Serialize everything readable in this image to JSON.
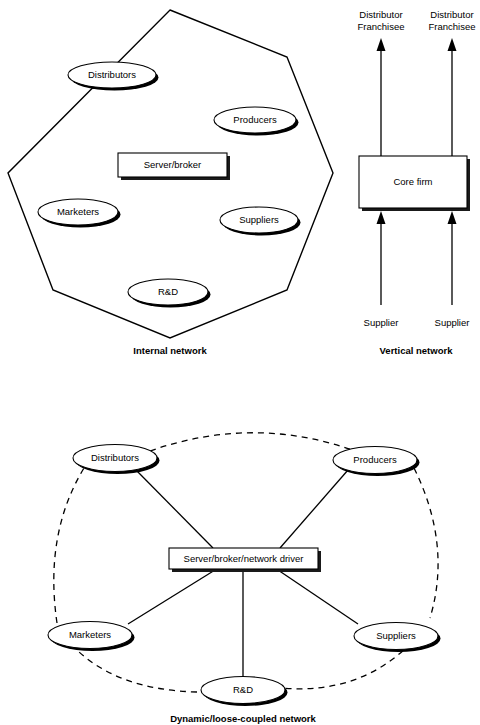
{
  "figure": {
    "panels": [
      {
        "id": "internal-network",
        "caption": "Internal network",
        "center_box": "Server/broker",
        "nodes": [
          {
            "id": "distributors",
            "label": "Distributors"
          },
          {
            "id": "producers",
            "label": "Producers"
          },
          {
            "id": "marketers",
            "label": "Marketers"
          },
          {
            "id": "suppliers",
            "label": "Suppliers"
          },
          {
            "id": "rnd",
            "label": "R&D"
          }
        ]
      },
      {
        "id": "vertical-network",
        "caption": "Vertical network",
        "center_box": "Core firm",
        "top_labels": [
          {
            "id": "distributor-franchisee-left",
            "line1": "Distributor",
            "line2": "Franchisee"
          },
          {
            "id": "distributor-franchisee-right",
            "line1": "Distributor",
            "line2": "Franchisee"
          }
        ],
        "bottom_labels": [
          {
            "id": "supplier-left",
            "label": "Supplier"
          },
          {
            "id": "supplier-right",
            "label": "Supplier"
          }
        ]
      },
      {
        "id": "dynamic-network",
        "caption": "Dynamic/loose-coupled network",
        "center_box": "Server/broker/network driver",
        "nodes": [
          {
            "id": "distributors",
            "label": "Distributors"
          },
          {
            "id": "producers",
            "label": "Producers"
          },
          {
            "id": "marketers",
            "label": "Marketers"
          },
          {
            "id": "suppliers",
            "label": "Suppliers"
          },
          {
            "id": "rnd",
            "label": "R&D"
          }
        ]
      }
    ],
    "colors": {
      "stroke": "#000000",
      "fill": "#ffffff",
      "shadow": "#1a1a1a"
    }
  }
}
